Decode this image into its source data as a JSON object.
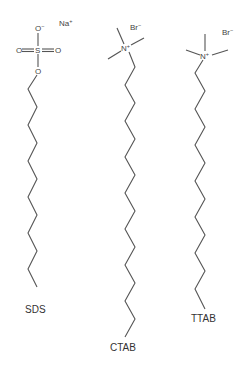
{
  "molecules": [
    {
      "name": "SDS",
      "label": "SDS",
      "counterion": {
        "symbol": "Na",
        "charge": "+"
      },
      "headgroup": {
        "central_atom": "S",
        "atoms": [
          {
            "symbol": "O",
            "charge": "−",
            "position": "top"
          },
          {
            "symbol": "O",
            "charge": "",
            "position": "left"
          },
          {
            "symbol": "O",
            "charge": "",
            "position": "right"
          },
          {
            "symbol": "O",
            "charge": "",
            "position": "bottom"
          }
        ]
      },
      "chain_carbons": 12
    },
    {
      "name": "CTAB",
      "label": "CTAB",
      "counterion": {
        "symbol": "Br",
        "charge": "−"
      },
      "headgroup": {
        "central_atom": "N",
        "charge": "+",
        "methyl_groups": 3
      },
      "chain_carbons": 16
    },
    {
      "name": "TTAB",
      "label": "TTAB",
      "counterion": {
        "symbol": "Br",
        "charge": "−"
      },
      "headgroup": {
        "central_atom": "N",
        "charge": "+",
        "methyl_groups": 3
      },
      "chain_carbons": 14
    }
  ],
  "colors": {
    "bond": "#555555",
    "text": "#333333",
    "background": "#ffffff"
  }
}
